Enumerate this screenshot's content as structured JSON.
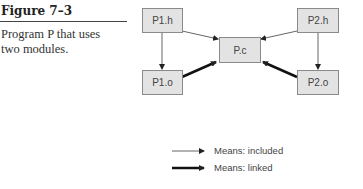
{
  "caption": {
    "figure_label": "Figure 7–3",
    "description_line1": "Program P that uses",
    "description_line2": "two modules."
  },
  "nodes": {
    "p1h": "P1.h",
    "p1o": "P1.o",
    "pc": "P.c",
    "p2h": "P2.h",
    "p2o": "P2.o"
  },
  "edges": [
    {
      "from": "P1.h",
      "to": "P1.o",
      "type": "included"
    },
    {
      "from": "P1.h",
      "to": "P.c",
      "type": "included"
    },
    {
      "from": "P2.h",
      "to": "P2.o",
      "type": "included"
    },
    {
      "from": "P2.h",
      "to": "P.c",
      "type": "included"
    },
    {
      "from": "P1.o",
      "to": "P.c",
      "type": "linked"
    },
    {
      "from": "P2.o",
      "to": "P.c",
      "type": "linked"
    }
  ],
  "legend": {
    "included": "Means: included",
    "linked": "Means: linked"
  }
}
